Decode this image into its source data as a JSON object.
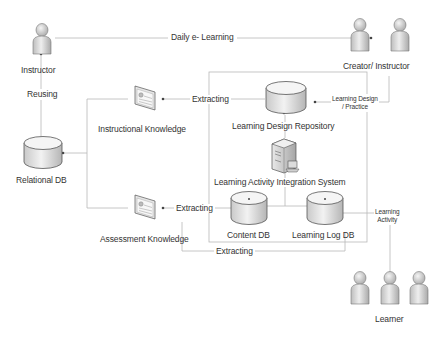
{
  "diagram": {
    "actors": {
      "instructor": {
        "label": "Instructor"
      },
      "creator_instructor": {
        "label": "Creator/  Instructor"
      },
      "learner": {
        "label": "Learner"
      }
    },
    "stores": {
      "relational_db": {
        "label": "Relational DB"
      },
      "learning_design_repository": {
        "label": "Learning Design Repository"
      },
      "content_db": {
        "label": "Content DB"
      },
      "learning_log_db": {
        "label": "Learning Log DB"
      }
    },
    "documents": {
      "instructional_knowledge": {
        "label": "Instructional Knowledge"
      },
      "assessment_knowledge": {
        "label": "Assessment Knowledge"
      }
    },
    "systems": {
      "integration_system": {
        "label": "Learning Activity Integration System"
      }
    },
    "edges": {
      "daily_elearning": "Daily e- Learning",
      "reusing": "Reusing",
      "extracting_instructional": "Extracting",
      "extracting_assessment": "Extracting",
      "extracting_log": "Extracting",
      "learning_design_practice_1": "Learning Design",
      "learning_design_practice_2": "/ Practice",
      "learning_activity_1": "Learning",
      "learning_activity_2": "Activity"
    },
    "colors": {
      "line": "#b8b8b8",
      "icon_fill": "#d9d9d9",
      "icon_stroke": "#555555",
      "text": "#333333"
    }
  }
}
